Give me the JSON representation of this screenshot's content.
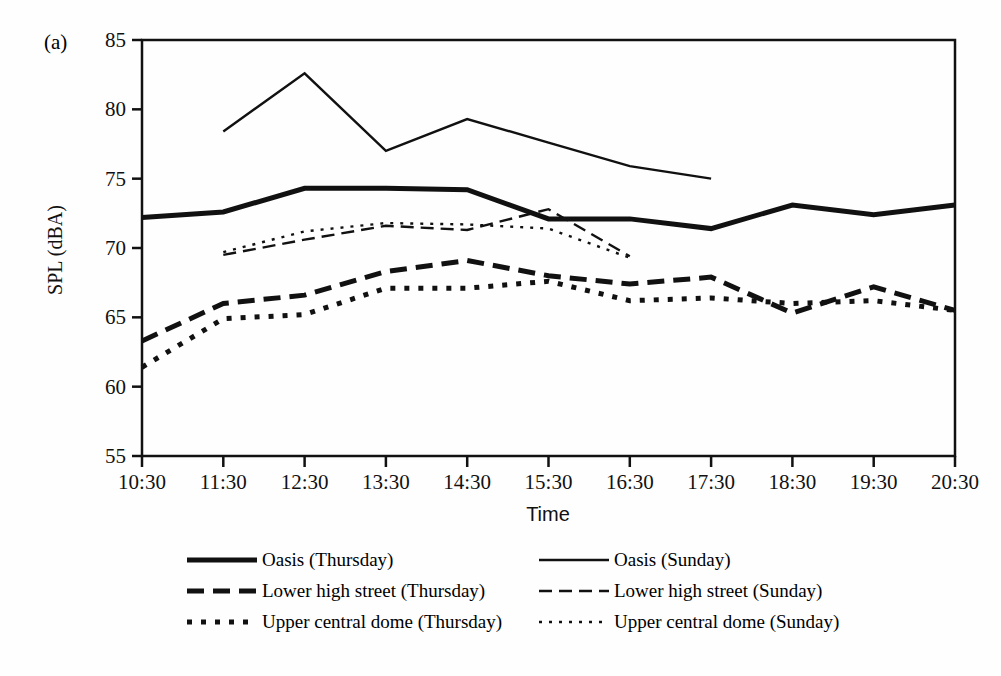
{
  "panel_label": "(a)",
  "chart_data": {
    "type": "line",
    "title": "",
    "xlabel": "Time",
    "ylabel": "SPL (dBA)",
    "categories": [
      "10:30",
      "11:30",
      "12:30",
      "13:30",
      "14:30",
      "15:30",
      "16:30",
      "17:30",
      "18:30",
      "19:30",
      "20:30"
    ],
    "ylim": [
      55,
      85
    ],
    "yticks": [
      55,
      60,
      65,
      70,
      75,
      80,
      85
    ],
    "grid": false,
    "legend_position": "below",
    "series": [
      {
        "name": "Oasis (Thursday)",
        "style": "solid-thick",
        "x": [
          "10:30",
          "11:30",
          "12:30",
          "13:30",
          "14:30",
          "15:30",
          "16:30",
          "17:30",
          "18:30",
          "19:30",
          "20:30"
        ],
        "values": [
          72.2,
          72.6,
          74.3,
          74.3,
          74.2,
          72.1,
          72.1,
          71.4,
          73.1,
          72.4,
          73.1
        ]
      },
      {
        "name": "Oasis (Sunday)",
        "style": "solid-thin",
        "x": [
          "11:30",
          "12:30",
          "13:30",
          "14:30",
          "15:30",
          "16:30",
          "17:30"
        ],
        "values": [
          78.4,
          82.6,
          77.0,
          79.3,
          77.6,
          75.9,
          75.0
        ]
      },
      {
        "name": "Lower high street (Thursday)",
        "style": "dashed-thick",
        "x": [
          "10:30",
          "11:30",
          "12:30",
          "13:30",
          "14:30",
          "15:30",
          "16:30",
          "17:30",
          "18:30",
          "19:30",
          "20:30"
        ],
        "values": [
          63.3,
          66.0,
          66.6,
          68.3,
          69.1,
          68.0,
          67.4,
          67.9,
          65.3,
          67.2,
          65.5
        ]
      },
      {
        "name": "Lower high street (Sunday)",
        "style": "dashed-thin",
        "x": [
          "11:30",
          "12:30",
          "13:30",
          "14:30",
          "15:30",
          "16:30"
        ],
        "values": [
          69.5,
          70.6,
          71.6,
          71.3,
          72.8,
          69.4
        ]
      },
      {
        "name": "Upper central dome (Thursday)",
        "style": "dotted-thick",
        "x": [
          "10:30",
          "11:30",
          "12:30",
          "13:30",
          "14:30",
          "15:30",
          "16:30",
          "17:30",
          "18:30",
          "19:30",
          "20:30"
        ],
        "values": [
          61.4,
          64.9,
          65.2,
          67.1,
          67.1,
          67.6,
          66.2,
          66.4,
          66.0,
          66.2,
          65.5
        ]
      },
      {
        "name": "Upper central dome (Sunday)",
        "style": "dotted-thin",
        "x": [
          "11:30",
          "12:30",
          "13:30",
          "14:30",
          "15:30",
          "16:30"
        ],
        "values": [
          69.7,
          71.2,
          71.8,
          71.7,
          71.4,
          69.3
        ]
      }
    ],
    "legend": [
      {
        "label": "Oasis (Thursday)",
        "style": "solid-thick"
      },
      {
        "label": "Oasis (Sunday)",
        "style": "solid-thin"
      },
      {
        "label": "Lower high street (Thursday)",
        "style": "dashed-thick"
      },
      {
        "label": "Lower high street (Sunday)",
        "style": "dashed-thin"
      },
      {
        "label": "Upper central dome (Thursday)",
        "style": "dotted-thick"
      },
      {
        "label": "Upper central dome (Sunday)",
        "style": "dotted-thin"
      }
    ]
  }
}
